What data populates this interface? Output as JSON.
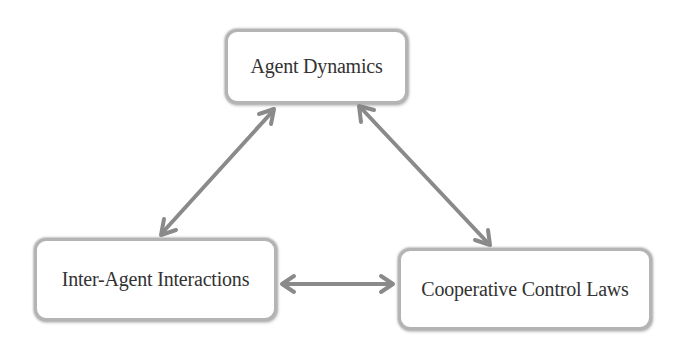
{
  "diagram": {
    "nodes": [
      {
        "id": "agent-dynamics",
        "label": "Agent Dynamics"
      },
      {
        "id": "inter-agent-interactions",
        "label": "Inter-Agent Interactions"
      },
      {
        "id": "cooperative-control-laws",
        "label": "Cooperative Control Laws"
      }
    ],
    "edges": [
      {
        "from": "agent-dynamics",
        "to": "inter-agent-interactions",
        "direction": "bidirectional"
      },
      {
        "from": "agent-dynamics",
        "to": "cooperative-control-laws",
        "direction": "bidirectional"
      },
      {
        "from": "inter-agent-interactions",
        "to": "cooperative-control-laws",
        "direction": "bidirectional"
      }
    ],
    "colors": {
      "arrow": "#8a8a8a",
      "node_border": "#b4b4b4",
      "text": "#333333",
      "background": "#ffffff"
    }
  }
}
